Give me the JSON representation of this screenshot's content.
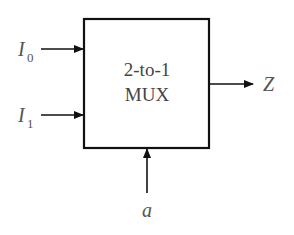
{
  "diagram": {
    "type": "block-diagram",
    "component": {
      "line1": "2-to-1",
      "line2": "MUX"
    },
    "inputs": [
      {
        "name": "I",
        "subscript": "0"
      },
      {
        "name": "I",
        "subscript": "1"
      }
    ],
    "select": {
      "name": "a"
    },
    "output": {
      "name": "Z"
    },
    "colors": {
      "stroke": "#111111",
      "text": "#555555",
      "background": "#ffffff"
    }
  }
}
